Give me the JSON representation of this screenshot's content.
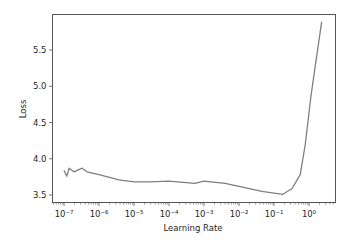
{
  "chart_data": {
    "type": "line",
    "title": "",
    "xlabel": "Learning Rate",
    "ylabel": "Loss",
    "xscale": "log",
    "xlim": [
      6.5e-08,
      5.5
    ],
    "ylim": [
      3.43,
      5.98
    ],
    "grid": false,
    "legend": null,
    "line_color": "#7f7f7f",
    "x_ticks": [
      {
        "value": 1e-07,
        "label": "10⁻⁷"
      },
      {
        "value": 1e-06,
        "label": "10⁻⁶"
      },
      {
        "value": 1e-05,
        "label": "10⁻⁵"
      },
      {
        "value": 0.0001,
        "label": "10⁻⁴"
      },
      {
        "value": 0.001,
        "label": "10⁻³"
      },
      {
        "value": 0.01,
        "label": "10⁻²"
      },
      {
        "value": 0.1,
        "label": "10⁻¹"
      },
      {
        "value": 1,
        "label": "10⁰"
      }
    ],
    "y_ticks": [
      {
        "value": 3.5,
        "label": "3.5"
      },
      {
        "value": 4.0,
        "label": "4.0"
      },
      {
        "value": 4.5,
        "label": "4.5"
      },
      {
        "value": 5.0,
        "label": "5.0"
      },
      {
        "value": 5.5,
        "label": "5.5"
      }
    ],
    "series": [
      {
        "name": "loss",
        "x": [
          1e-07,
          1.2e-07,
          1.4e-07,
          1.9e-07,
          3.3e-07,
          4.5e-07,
          1e-06,
          3.7e-06,
          1e-05,
          2.9e-05,
          0.0001,
          0.00055,
          0.001,
          0.004,
          0.01,
          0.045,
          0.18,
          0.33,
          0.56,
          0.78,
          1.15,
          1.6,
          2.3
        ],
        "y": [
          3.84,
          3.76,
          3.87,
          3.82,
          3.87,
          3.82,
          3.78,
          3.71,
          3.68,
          3.68,
          3.69,
          3.66,
          3.69,
          3.66,
          3.62,
          3.55,
          3.51,
          3.59,
          3.78,
          4.19,
          4.88,
          5.36,
          5.89
        ]
      }
    ]
  }
}
